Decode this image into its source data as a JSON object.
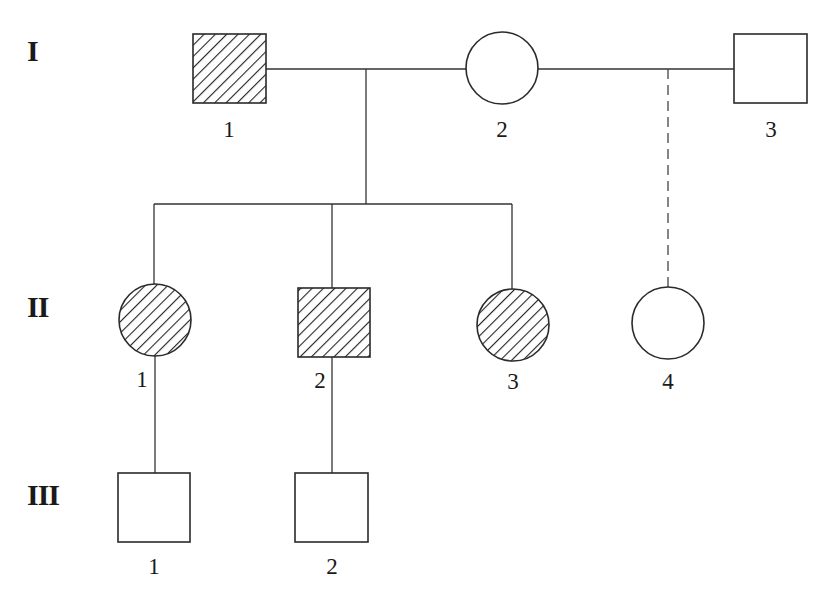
{
  "diagram": {
    "type": "pedigree",
    "colors": {
      "line": "#333333",
      "shape_stroke": "#2a2a2a",
      "hatch": "#222222",
      "background": "#ffffff"
    },
    "legend_note": "hatched = affected; open = unaffected; dashed line = descent line from second union",
    "generations": [
      {
        "label": "I",
        "individuals": [
          {
            "id": "I-1",
            "number": "1",
            "sex": "male",
            "affected": true
          },
          {
            "id": "I-2",
            "number": "2",
            "sex": "female",
            "affected": false
          },
          {
            "id": "I-3",
            "number": "3",
            "sex": "male",
            "affected": false
          }
        ]
      },
      {
        "label": "II",
        "individuals": [
          {
            "id": "II-1",
            "number": "1",
            "sex": "female",
            "affected": true,
            "parents": [
              "I-1",
              "I-2"
            ]
          },
          {
            "id": "II-2",
            "number": "2",
            "sex": "male",
            "affected": true,
            "parents": [
              "I-1",
              "I-2"
            ]
          },
          {
            "id": "II-3",
            "number": "3",
            "sex": "female",
            "affected": true,
            "parents": [
              "I-1",
              "I-2"
            ]
          },
          {
            "id": "II-4",
            "number": "4",
            "sex": "female",
            "affected": false,
            "parents": [
              "I-2",
              "I-3"
            ],
            "line_style": "dashed"
          }
        ]
      },
      {
        "label": "III",
        "individuals": [
          {
            "id": "III-1",
            "number": "1",
            "sex": "male",
            "affected": false,
            "parent": "II-1"
          },
          {
            "id": "III-2",
            "number": "2",
            "sex": "male",
            "affected": false,
            "parent": "II-2"
          }
        ]
      }
    ],
    "unions": [
      {
        "partners": [
          "I-1",
          "I-2"
        ],
        "children": [
          "II-1",
          "II-2",
          "II-3"
        ]
      },
      {
        "partners": [
          "I-2",
          "I-3"
        ],
        "children": [
          "II-4"
        ],
        "descent_line": "dashed"
      }
    ]
  },
  "gen_labels": {
    "g1": "I",
    "g2": "II",
    "g3": "III"
  },
  "ind_labels": {
    "I_1": "1",
    "I_2": "2",
    "I_3": "3",
    "II_1": "1",
    "II_2": "2",
    "II_3": "3",
    "II_4": "4",
    "III_1": "1",
    "III_2": "2"
  }
}
